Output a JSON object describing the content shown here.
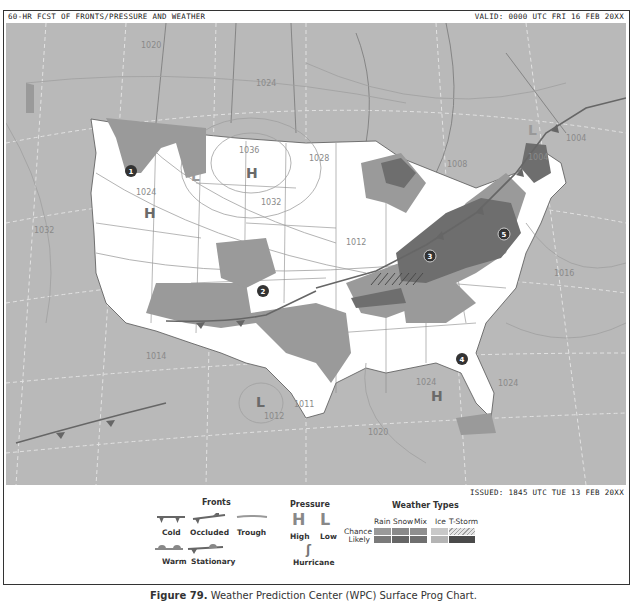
{
  "header": {
    "title": "60-HR FCST OF FRONTS/PRESSURE AND WEATHER",
    "valid": "VALID: 0000 UTC FRI 16 FEB 20XX",
    "issued": "ISSUED: 1845 UTC TUE 13 FEB 20XX"
  },
  "map": {
    "isobars": [
      "1020",
      "1024",
      "1036",
      "1028",
      "1024",
      "1032",
      "1032",
      "1016",
      "1012",
      "1008",
      "1004",
      "1004",
      "1016",
      "1014",
      "1011",
      "1012",
      "1024",
      "1024",
      "1020"
    ],
    "pressure_centers": [
      {
        "type": "H",
        "label": "H"
      },
      {
        "type": "H",
        "label": "H"
      },
      {
        "type": "H",
        "label": "H"
      },
      {
        "type": "L",
        "label": "L"
      },
      {
        "type": "L",
        "label": "L"
      },
      {
        "type": "L",
        "label": "L"
      }
    ],
    "markers": [
      "1",
      "2",
      "3",
      "4",
      "5"
    ]
  },
  "legend": {
    "fronts": {
      "title": "Fronts",
      "cold": "Cold",
      "occluded": "Occluded",
      "trough": "Trough",
      "warm": "Warm",
      "stationary": "Stationary"
    },
    "pressure": {
      "title": "Pressure",
      "high_symbol": "H",
      "low_symbol": "L",
      "high": "High",
      "low": "Low",
      "hurricane": "Hurricane",
      "hurricane_symbol": "ʃ"
    },
    "weather_types": {
      "title": "Weather Types",
      "columns": [
        "Rain",
        "Snow",
        "Mix",
        "Ice",
        "T-Storm"
      ],
      "rows": [
        "Chance",
        "Likely"
      ],
      "colors": {
        "chance": [
          "#9a9a9a",
          "#8a8a8a",
          "#8f8f8f",
          "#c8c8c8",
          "#e4e4e4"
        ],
        "likely": [
          "#7a7a7a",
          "#666666",
          "#6f6f6f",
          "#b4b4b4",
          "#4a4a4a"
        ]
      }
    }
  },
  "caption": {
    "figure": "Figure 79.",
    "text": " Weather Prediction Center (WPC) Surface Prog Chart."
  },
  "colors": {
    "ocean_canada": "#b9b9b9",
    "us_land": "#ffffff",
    "precip_chance": "#9a9a9a",
    "precip_likely": "#6e6e6e",
    "front": "#666666"
  }
}
